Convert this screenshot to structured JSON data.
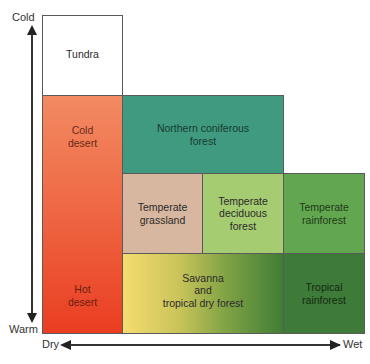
{
  "axes": {
    "y_top": "Cold",
    "y_bottom": "Warm",
    "x_left": "Dry",
    "x_right": "Wet"
  },
  "biomes": {
    "tundra": "Tundra",
    "cold_desert_1": "Cold",
    "cold_desert_2": "desert",
    "hot_desert_1": "Hot",
    "hot_desert_2": "desert",
    "northern_1": "Northern coniferous",
    "northern_2": "forest",
    "grassland_1": "Temperate",
    "grassland_2": "grassland",
    "deciduous_1": "Temperate",
    "deciduous_2": "deciduous",
    "deciduous_3": "forest",
    "temp_rain_1": "Temperate",
    "temp_rain_2": "rainforest",
    "savanna_1": "Savanna",
    "savanna_2": "and",
    "savanna_3": "tropical dry forest",
    "trop_rain_1": "Tropical",
    "trop_rain_2": "rainforest"
  },
  "colors": {
    "tundra": "#ffffff",
    "cold_desert": "#f07a55",
    "hot_desert": "#ec4a2a",
    "northern_coniferous": "#3f9a80",
    "temperate_grassland": "#d8b7a0",
    "temperate_deciduous": "#a6cc72",
    "temperate_rainforest": "#63a650",
    "savanna_start": "#f4d66a",
    "savanna_end": "#3f7d35",
    "tropical_rainforest": "#3e7a38"
  }
}
